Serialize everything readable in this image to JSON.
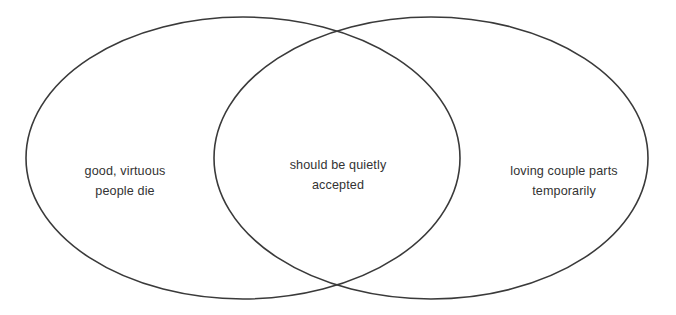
{
  "diagram": {
    "type": "venn",
    "set_count": 2,
    "stroke_color": "#3a3a3a",
    "text_color": "#333333",
    "background_color": "#ffffff",
    "regions": [
      {
        "id": "left-only",
        "position": "left",
        "lines": [
          "good, virtuous",
          "people die"
        ]
      },
      {
        "id": "intersection",
        "position": "center",
        "lines": [
          "should be quietly",
          "accepted"
        ]
      },
      {
        "id": "right-only",
        "position": "right",
        "lines": [
          "loving couple parts",
          "temporarily"
        ]
      }
    ],
    "geometry": {
      "left_ellipse": {
        "cx": 243,
        "cy": 158,
        "rx": 217,
        "ry": 141
      },
      "right_ellipse": {
        "cx": 431,
        "cy": 158,
        "rx": 217,
        "ry": 141
      },
      "stroke_width": 1.6
    }
  }
}
